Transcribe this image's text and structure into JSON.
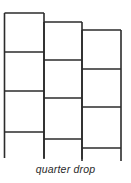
{
  "diagram": {
    "title": "quarter drop",
    "caption": "quarter drop",
    "line_color": "#2b2b2b",
    "columns": [
      {
        "label": "strip-1",
        "x_left": 4.5,
        "x_right": 44,
        "rows_y": [
          13,
          52,
          91,
          132
        ],
        "bottom_y": 158
      },
      {
        "label": "strip-2",
        "x_left": 44,
        "x_right": 82,
        "rows_y": [
          22,
          60,
          98,
          139
        ],
        "bottom_y": 159
      },
      {
        "label": "strip-3",
        "x_left": 82,
        "x_right": 121,
        "rows_y": [
          30,
          69,
          107,
          148
        ],
        "bottom_y": 161
      }
    ]
  }
}
